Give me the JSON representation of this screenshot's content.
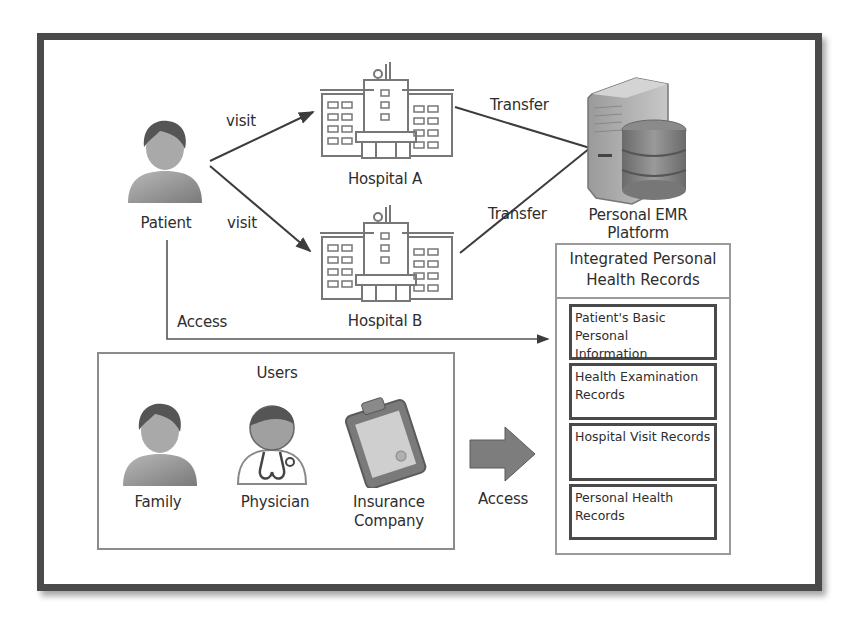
{
  "diagram": {
    "actors": {
      "patient": {
        "label": "Patient",
        "icon": "person-icon"
      },
      "hospital_a": {
        "label": "Hospital A",
        "icon": "hospital-icon"
      },
      "hospital_b": {
        "label": "Hospital B",
        "icon": "hospital-icon"
      },
      "platform": {
        "label_line1": "Personal EMR",
        "label_line2": "Platform",
        "icon": "server-database-icon"
      }
    },
    "edges": {
      "visit_a": "visit",
      "visit_b": "visit",
      "transfer_a": "Transfer",
      "transfer_b": "Transfer",
      "patient_access": "Access",
      "users_access": "Access"
    },
    "users": {
      "title": "Users",
      "items": [
        {
          "label": "Family",
          "icon": "person-icon"
        },
        {
          "label": "Physician",
          "icon": "doctor-icon"
        },
        {
          "label_line1": "Insurance",
          "label_line2": "Company",
          "icon": "clipboard-icon"
        }
      ]
    },
    "records_panel": {
      "title_line1": "Integrated Personal",
      "title_line2": "Health Records",
      "items": [
        {
          "line1": "Patient's Basic Personal",
          "line2": "Information"
        },
        {
          "line1": "Health Examination",
          "line2": "Records"
        },
        {
          "line1": "Hospital Visit Records",
          "line2": ""
        },
        {
          "line1": "Personal Health",
          "line2": "Records"
        }
      ]
    },
    "colors": {
      "frame": "#4a4a4a",
      "line": "#3c3c3c",
      "icon_gray": "#8a8a8a",
      "box_border": "#9a9a9a",
      "arrow_fill": "#7d7d7d"
    }
  }
}
